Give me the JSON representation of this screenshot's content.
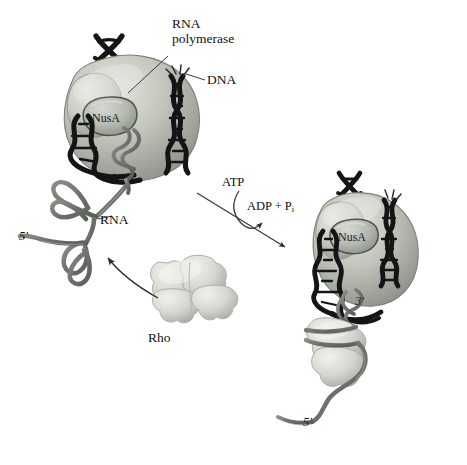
{
  "figure": {
    "background_color": "#ffffff",
    "width": 467,
    "height": 465
  },
  "labels": {
    "rna_polymerase": "RNA\npolymerase",
    "dna": "DNA",
    "rna": "RNA",
    "rho": "Rho",
    "atp": "ATP",
    "adp_pi_prefix": "ADP + P",
    "adp_pi_subscript": "i",
    "five_prime_left": "5′",
    "five_prime_right": "5′",
    "three_prime": "3′",
    "nusa_left": "NusA",
    "nusa_right": "NusA"
  },
  "colors": {
    "polymerase_fill": "#b9bdb4",
    "polymerase_highlight": "#d9dcd4",
    "polymerase_shadow": "#8f948b",
    "nusa_fill": "#aeb3aa",
    "nusa_edge": "#5e635c",
    "dna_dark": "#1a1a1a",
    "rna_strand": "#6e726c",
    "rho_fill": "#cfd2cb",
    "rho_highlight": "#e8eae4",
    "rho_shadow": "#a3a79f",
    "label_text": "#111111",
    "leader_line": "#3a3a3a",
    "arrow": "#2b2b2b"
  },
  "elements": {
    "left_complex": {
      "name": "Elongation complex before termination",
      "parts": [
        "RNA polymerase",
        "NusA",
        "DNA duplex",
        "nascent RNA with hairpins"
      ]
    },
    "right_complex": {
      "name": "Complex after Rho binding and translocation",
      "parts": [
        "RNA polymerase",
        "NusA",
        "DNA duplex",
        "Rho hexamer on RNA",
        "RNA 5' tail"
      ]
    },
    "rho_free": {
      "name": "Free Rho hexamer"
    },
    "reaction": {
      "substrate": "ATP",
      "products": "ADP + Pi",
      "direction": "left-to-right"
    }
  }
}
